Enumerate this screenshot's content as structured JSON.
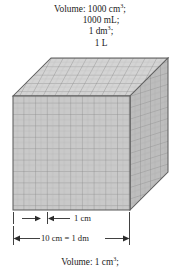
{
  "figure": {
    "name": "cubic-decimeter-volume-diagram",
    "top_caption": {
      "lines": [
        {
          "text": "Volume: 1000 cm3;",
          "pre": "Volume: 1000 cm",
          "sup": "3",
          "post": ";",
          "indent": false
        },
        {
          "text": "1000 mL;",
          "pre": "1000 mL;",
          "sup": "",
          "post": "",
          "indent": true
        },
        {
          "text": "1 dm3;",
          "pre": "1 dm",
          "sup": "3",
          "post": ";",
          "indent": true
        },
        {
          "text": "1 L",
          "pre": "1 L",
          "sup": "",
          "post": "",
          "indent": true
        }
      ]
    },
    "bottom_caption": {
      "pre": "Volume: 1 cm",
      "sup": "3",
      "post": ";"
    },
    "dimension_labels": {
      "unit_cell": "1 cm",
      "full_edge": "10 cm = 1 dm"
    },
    "cube": {
      "divisions": 10,
      "front_face_color": "#c9c9c9",
      "top_face_color": "#d4d4d4",
      "side_face_color": "#bdbdbd",
      "grid_line_color": "#8a8a8a",
      "minor_grid_line_color": "#a8a8a8",
      "outline_color": "#5e5e5e"
    },
    "colors": {
      "background": "#ffffff",
      "text": "#1a1a1a",
      "rule": "#2b2b2b"
    }
  }
}
